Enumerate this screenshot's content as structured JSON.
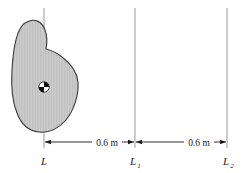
{
  "figure": {
    "background_color": "#ffffff",
    "width": 244,
    "height": 173
  },
  "body": {
    "name": "irregular rigid body",
    "fill_color": "#c9c9c9",
    "outline_color": "#3a3a3a",
    "hatch": "vertical fine lines"
  },
  "center_of_mass": {
    "symbol": "quartered circle",
    "x": 44,
    "y": 87,
    "radius": 5
  },
  "axes": [
    {
      "id": "L",
      "label": "L",
      "subscript": "",
      "x": 44
    },
    {
      "id": "L1",
      "label": "L",
      "subscript": "1",
      "x": 135
    },
    {
      "id": "L2",
      "label": "L",
      "subscript": "2",
      "x": 227
    }
  ],
  "dimensions": [
    {
      "id": "d1",
      "label": "0.6 m",
      "from": "L",
      "to": "L1",
      "value": 0.6,
      "unit": "m"
    },
    {
      "id": "d2",
      "label": "0.6 m",
      "from": "L1",
      "to": "L2",
      "value": 0.6,
      "unit": "m"
    }
  ],
  "line_color": "#9a9a9a",
  "dim_line_color": "#1a1a1a"
}
